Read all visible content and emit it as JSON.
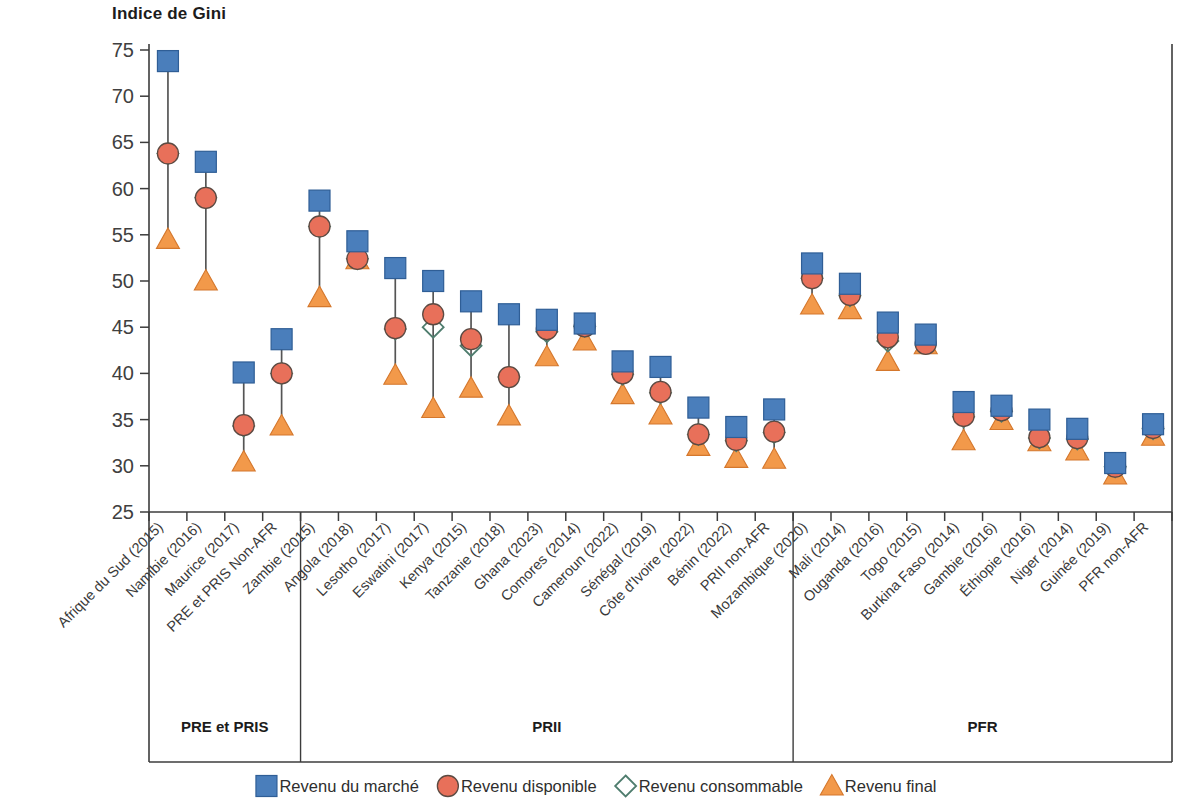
{
  "chart_data": {
    "type": "scatter",
    "title": "",
    "ylabel": "Indice de Gini",
    "xlabel": "",
    "ylim": [
      25,
      75
    ],
    "ytick_step": 5,
    "yticks": [
      25,
      30,
      35,
      40,
      45,
      50,
      55,
      60,
      65,
      70,
      75
    ],
    "grid": false,
    "legend_position": "bottom",
    "legend": [
      {
        "key": "marche",
        "label": "Revenu du marché",
        "marker": "square",
        "color": "#4a7ebb"
      },
      {
        "key": "disponible",
        "label": "Revenu disponible",
        "marker": "circle",
        "color": "#e8705a"
      },
      {
        "key": "consommable",
        "label": "Revenu consommable",
        "marker": "diamond-open",
        "color": "#4f7d6e"
      },
      {
        "key": "final",
        "label": "Revenu final",
        "marker": "triangle",
        "color": "#f2994a"
      }
    ],
    "series": [
      {
        "name": "Revenu du marché",
        "key": "marche",
        "marker": "square",
        "color": "#4a7ebb",
        "values": [
          73.8,
          62.9,
          40.1,
          43.7,
          58.7,
          54.3,
          51.4,
          50.0,
          47.8,
          46.4,
          45.8,
          45.4,
          41.3,
          40.7,
          36.3,
          34.2,
          36.1,
          51.9,
          49.7,
          45.5,
          44.2,
          36.9,
          36.5,
          35.0,
          34.0,
          30.3,
          34.5
        ]
      },
      {
        "name": "Revenu disponible",
        "key": "disponible",
        "marker": "circle",
        "color": "#e8705a",
        "values": [
          63.8,
          59.0,
          34.4,
          40.0,
          55.9,
          52.4,
          44.9,
          46.4,
          43.7,
          39.6,
          44.8,
          45.1,
          40.0,
          38.0,
          33.4,
          32.8,
          33.7,
          50.3,
          48.5,
          43.9,
          43.2,
          35.4,
          36.0,
          33.1,
          33.0,
          29.9,
          34.1
        ]
      },
      {
        "name": "Revenu consommable",
        "key": "consommable",
        "marker": "diamond-open",
        "color": "#4f7d6e",
        "values": [
          63.8,
          59.0,
          34.3,
          40.0,
          55.9,
          52.4,
          44.8,
          45.0,
          43.0,
          39.6,
          44.5,
          45.1,
          39.9,
          37.9,
          33.4,
          32.7,
          33.6,
          50.3,
          48.4,
          43.5,
          null,
          35.3,
          35.9,
          33.0,
          32.9,
          29.9,
          34.0
        ]
      },
      {
        "name": "Revenu final",
        "key": "final",
        "marker": "triangle",
        "color": "#f2994a",
        "values": [
          54.5,
          50.0,
          30.4,
          34.3,
          48.2,
          52.3,
          39.8,
          36.2,
          38.4,
          35.4,
          41.8,
          43.5,
          37.7,
          35.5,
          32.1,
          30.8,
          30.7,
          47.4,
          46.9,
          41.3,
          43.1,
          32.7,
          34.9,
          32.6,
          31.6,
          29.0,
          33.2
        ]
      }
    ],
    "categories": [
      "Afrique du Sud (2015)",
      "Namibie (2016)",
      "Maurice (2017)",
      "PRE et PRIS Non-AFR",
      "Zambie (2015)",
      "Angola (2018)",
      "Lesotho (2017)",
      "Eswatini (2017)",
      "Kenya (2015)",
      "Tanzanie (2018)",
      "Ghana (2023)",
      "Comores (2014)",
      "Cameroun (2022)",
      "Sénégal (2019)",
      "Côte d'Ivoire (2022)",
      "Bénin (2022)",
      "PRII non-AFR",
      "Mozambique (2020)",
      "Mali (2014)",
      "Ouganda (2016)",
      "Togo (2015)",
      "Burkina Faso (2014)",
      "Gambie (2016)",
      "Éthiopie (2016)",
      "Niger (2014)",
      "Guinée (2019)",
      "PFR non-AFR"
    ],
    "groups": [
      {
        "label": "PRE et PRIS",
        "start_index": 0,
        "end_index": 3
      },
      {
        "label": "PRII",
        "start_index": 4,
        "end_index": 16
      },
      {
        "label": "PFR",
        "start_index": 17,
        "end_index": 26
      }
    ]
  }
}
